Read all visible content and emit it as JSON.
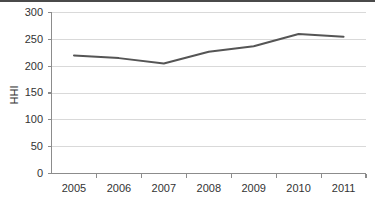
{
  "chart_data": {
    "type": "line",
    "title": "",
    "xlabel": "",
    "ylabel": "HHI",
    "categories": [
      "2005",
      "2006",
      "2007",
      "2008",
      "2009",
      "2010",
      "2011"
    ],
    "values": [
      220,
      215,
      205,
      227,
      237,
      260,
      255
    ],
    "series": [
      {
        "name": "HHI",
        "values": [
          220,
          215,
          205,
          227,
          237,
          260,
          255
        ]
      }
    ],
    "ylim": [
      0,
      300
    ],
    "ytick_labels": [
      "0",
      "50",
      "100",
      "150",
      "200",
      "250",
      "300"
    ],
    "ytick_values": [
      0,
      50,
      100,
      150,
      200,
      250,
      300
    ],
    "grid": "horizontal",
    "legend": "none",
    "line_color": "#555555",
    "grid_color": "#d9d9d9",
    "axis_color": "#8c8c8c"
  }
}
